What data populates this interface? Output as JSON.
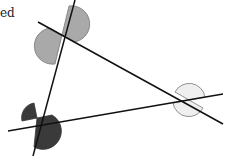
{
  "caption": {
    "text": "ed"
  },
  "diagram": {
    "type": "three intersecting lines forming a triangle with vertically opposite angles marked",
    "lines": [
      {
        "name": "line-top-to-right",
        "from": [
          38,
          22
        ],
        "to": [
          223,
          124
        ]
      },
      {
        "name": "line-left-steep",
        "from": [
          75,
          0
        ],
        "to": [
          33,
          156
        ]
      },
      {
        "name": "line-bottom",
        "from": [
          8,
          131
        ],
        "to": [
          223,
          94
        ]
      }
    ],
    "intersections": [
      {
        "name": "top-left-vertex",
        "point": [
          62,
          35
        ],
        "fill": "#a9a9a9",
        "radius": 14
      },
      {
        "name": "bottom-left-vertex",
        "point": [
          37,
          118
        ],
        "fill": "#3a3a3a",
        "radius": 15
      },
      {
        "name": "right-vertex",
        "point": [
          189,
          100
        ],
        "fill": "#efefef",
        "radius": 16
      }
    ],
    "colors": {
      "line": "#111111",
      "arc_stroke": "#777777"
    }
  }
}
